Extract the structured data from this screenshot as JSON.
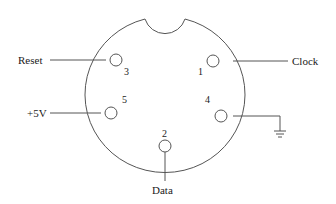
{
  "diagram": {
    "type": "connector-pinout",
    "pins": [
      {
        "number": "1",
        "signal": "Clock"
      },
      {
        "number": "2",
        "signal": "Data"
      },
      {
        "number": "3",
        "signal": "Reset"
      },
      {
        "number": "4",
        "signal": "Ground"
      },
      {
        "number": "5",
        "signal": "+5V"
      }
    ]
  },
  "labels": {
    "reset": "Reset",
    "clock": "Clock",
    "vcc": "+5V",
    "data": "Data"
  },
  "pin_numbers": {
    "p1": "1",
    "p2": "2",
    "p3": "3",
    "p4": "4",
    "p5": "5"
  },
  "icons": {
    "ground": "ground-symbol-icon"
  },
  "colors": {
    "line": "#555555",
    "text": "#1a1a1a",
    "background": "#ffffff"
  }
}
